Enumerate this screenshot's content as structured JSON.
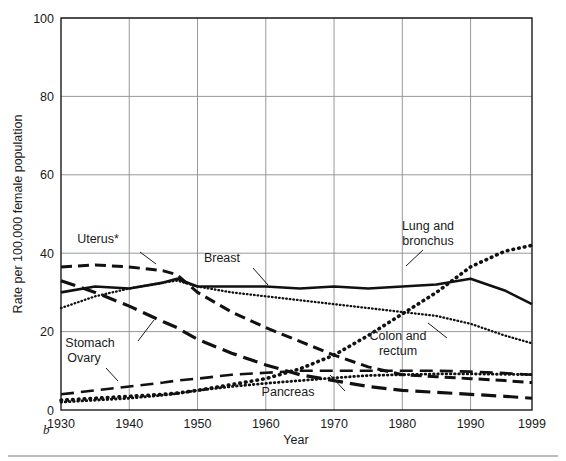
{
  "figure": {
    "letter": "b",
    "bottom_rule_color": "#b9bcc0"
  },
  "axes": {
    "y_label": "Rate per 100,000 female population",
    "x_label": "Year",
    "y_ticks": [
      "0",
      "20",
      "40",
      "60",
      "80",
      "100"
    ],
    "x_ticks": [
      "1930",
      "1940",
      "1950",
      "1960",
      "1970",
      "1980",
      "1990",
      "1999"
    ],
    "grid_color": "#8a8d91",
    "frame_color": "#1a1a1a"
  },
  "chart_data": {
    "type": "line",
    "title": "",
    "subtitle": "",
    "xlabel": "Year",
    "ylabel": "Rate per 100,000 female population",
    "xlim": [
      1930,
      1999
    ],
    "ylim": [
      0,
      100
    ],
    "grid": true,
    "legend": "inline-annotations",
    "x_tick_values": [
      1930,
      1940,
      1950,
      1960,
      1970,
      1980,
      1990,
      1999
    ],
    "y_tick_values": [
      0,
      20,
      40,
      60,
      80,
      100
    ],
    "x": [
      1930,
      1935,
      1940,
      1945,
      1947,
      1950,
      1955,
      1960,
      1965,
      1970,
      1975,
      1980,
      1985,
      1990,
      1995,
      1999
    ],
    "series": [
      {
        "name": "Lung and bronchus",
        "label": "Lung and bronchus",
        "style": "dotted-bold",
        "color": "#111111",
        "values": [
          2.5,
          3.0,
          3.5,
          4.0,
          4.3,
          5.0,
          6.5,
          8.0,
          10.5,
          14.0,
          19.0,
          24.5,
          30.0,
          36.5,
          40.5,
          42.0
        ]
      },
      {
        "name": "Breast",
        "label": "Breast",
        "style": "solid",
        "color": "#111111",
        "values": [
          30.0,
          31.5,
          31.0,
          32.5,
          33.5,
          31.5,
          31.5,
          31.5,
          31.0,
          31.5,
          31.0,
          31.5,
          32.0,
          33.5,
          30.5,
          27.0
        ]
      },
      {
        "name": "Uterus*",
        "label": "Uterus*",
        "style": "dashed",
        "color": "#111111",
        "values": [
          36.5,
          37.0,
          36.5,
          35.5,
          34.5,
          30.0,
          25.0,
          21.0,
          17.5,
          14.0,
          11.0,
          9.0,
          8.5,
          8.0,
          7.5,
          7.0
        ]
      },
      {
        "name": "Colon and rectum",
        "label": "Colon and rectum",
        "style": "dotted-fine",
        "color": "#111111",
        "values": [
          26.0,
          29.0,
          31.0,
          32.5,
          33.0,
          31.5,
          30.0,
          29.0,
          28.0,
          27.0,
          26.0,
          25.0,
          24.0,
          22.0,
          19.0,
          17.0
        ]
      },
      {
        "name": "Stomach",
        "label": "Stomach",
        "style": "long-dash",
        "color": "#111111",
        "values": [
          33.0,
          30.0,
          26.5,
          22.5,
          21.0,
          18.0,
          14.5,
          11.5,
          9.0,
          7.5,
          6.0,
          5.0,
          4.5,
          4.0,
          3.5,
          3.0
        ]
      },
      {
        "name": "Ovary",
        "label": "Ovary",
        "style": "long-dash-light",
        "color": "#111111",
        "values": [
          4.0,
          5.0,
          6.0,
          7.0,
          7.5,
          8.0,
          9.0,
          9.5,
          10.0,
          10.0,
          10.0,
          10.0,
          10.0,
          9.8,
          9.4,
          9.0
        ]
      },
      {
        "name": "Pancreas",
        "label": "Pancreas",
        "style": "dotted-medium",
        "color": "#111111",
        "values": [
          2.0,
          2.5,
          3.0,
          3.8,
          4.2,
          5.0,
          6.0,
          6.8,
          7.5,
          8.2,
          8.8,
          9.0,
          9.2,
          9.2,
          9.1,
          9.0
        ]
      }
    ],
    "annotations": [
      {
        "text": "Uterus*",
        "x_px": 98,
        "y_px": 243
      },
      {
        "text": "Breast",
        "x_px": 222,
        "y_px": 262
      },
      {
        "text": "Stomach",
        "x_px": 90,
        "y_px": 347
      },
      {
        "text": "Ovary",
        "x_px": 84,
        "y_px": 362
      },
      {
        "text": "Lung and",
        "x_px": 428,
        "y_px": 230
      },
      {
        "text": "bronchus",
        "x_px": 428,
        "y_px": 245
      },
      {
        "text": "Colon and",
        "x_px": 398,
        "y_px": 340
      },
      {
        "text": "rectum",
        "x_px": 398,
        "y_px": 355
      },
      {
        "text": "Pancreas",
        "x_px": 288,
        "y_px": 396
      }
    ]
  }
}
